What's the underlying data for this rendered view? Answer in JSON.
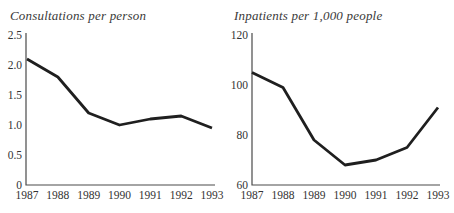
{
  "style": {
    "background": "#ffffff",
    "line_color": "#1f1f1f",
    "axis_color": "#4a4a4a",
    "text_color": "#333333",
    "title_color": "#3a3a3a"
  },
  "chart_data": [
    {
      "type": "line",
      "title": "Consultations per person",
      "x": [
        "1987",
        "1988",
        "1989",
        "1990",
        "1991",
        "1992",
        "1993"
      ],
      "values": [
        2.1,
        1.8,
        1.2,
        1.0,
        1.1,
        1.15,
        0.95
      ],
      "ylim": [
        0,
        2.5
      ],
      "yticks": [
        0,
        0.5,
        1.0,
        1.5,
        2.0,
        2.5
      ],
      "ytick_labels": [
        "0",
        "0.5",
        "1.0",
        "1.5",
        "2.0",
        "2.5"
      ],
      "xlabel": "",
      "ylabel": "",
      "grid": false,
      "legend": "none"
    },
    {
      "type": "line",
      "title": "Inpatients per 1,000 people",
      "x": [
        "1987",
        "1988",
        "1989",
        "1990",
        "1991",
        "1992",
        "1993"
      ],
      "values": [
        105,
        99,
        78,
        68,
        70,
        75,
        91
      ],
      "ylim": [
        60,
        120
      ],
      "yticks": [
        60,
        80,
        100,
        120
      ],
      "ytick_labels": [
        "60",
        "80",
        "100",
        "120"
      ],
      "xlabel": "",
      "ylabel": "",
      "grid": false,
      "legend": "none"
    }
  ]
}
